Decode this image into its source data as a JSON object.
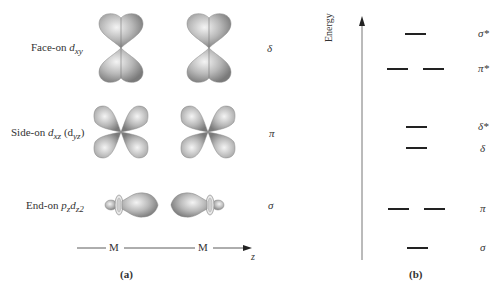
{
  "panel_a": {
    "caption": "(a)",
    "rows": [
      {
        "label_prefix": "Face-on ",
        "orbital": "d",
        "sub": "xy",
        "extra": "",
        "symmetry": "δ"
      },
      {
        "label_prefix": "Side-on ",
        "orbital": "d",
        "sub": "xz",
        "extra_open": " (d",
        "extra_sub": "yz",
        "extra_close": ")",
        "symmetry": "π"
      },
      {
        "label_prefix": "End-on ",
        "orbital": "p",
        "sub": "z",
        "orbital2": "d",
        "sub2": "z2",
        "symmetry": "σ"
      }
    ],
    "axis": {
      "atom1": "M",
      "atom2": "M",
      "axis_label": "z"
    }
  },
  "panel_b": {
    "caption": "(b)",
    "axis_label": "Energy",
    "levels": [
      {
        "label": "σ*",
        "degenerate": false
      },
      {
        "label": "π*",
        "degenerate": true
      },
      {
        "label": "δ*",
        "degenerate": false
      },
      {
        "label": "δ",
        "degenerate": false
      },
      {
        "label": "π",
        "degenerate": true
      },
      {
        "label": "σ",
        "degenerate": false
      }
    ]
  }
}
